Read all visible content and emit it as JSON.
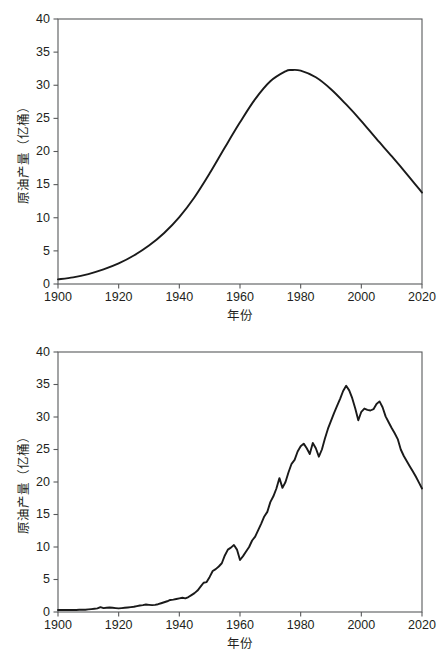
{
  "page": {
    "background": "#ffffff",
    "line_color": "#1a1a1a",
    "axis_color": "#58595b",
    "text_color": "#231f20"
  },
  "charts": [
    {
      "id": "top",
      "panel_label": "hubbert-curve-panel",
      "xlabel": "年份",
      "ylabel": "原油产量（亿桶）",
      "title": "",
      "xlim": [
        1900,
        2020
      ],
      "ylim": [
        0,
        40
      ],
      "xticks": [
        1900,
        1920,
        1940,
        1960,
        1980,
        2000,
        2020
      ],
      "xticklabels": [
        "1900",
        "1920",
        "1940",
        "1960",
        "1980",
        "2000",
        "2020"
      ],
      "yticks": [
        0,
        5,
        10,
        15,
        20,
        25,
        30,
        35,
        40
      ],
      "yticklabels": [
        "0",
        "5",
        "10",
        "15",
        "20",
        "25",
        "30",
        "35",
        "40"
      ],
      "grid": false,
      "legend": null
    },
    {
      "id": "bottom",
      "panel_label": "actual-production-panel",
      "xlabel": "年份",
      "ylabel": "原油产量（亿桶）",
      "title": "",
      "xlim": [
        1900,
        2020
      ],
      "ylim": [
        0,
        40
      ],
      "xticks": [
        1900,
        1920,
        1940,
        1960,
        1980,
        2000,
        2020
      ],
      "xticklabels": [
        "1900",
        "1920",
        "1940",
        "1960",
        "1980",
        "2000",
        "2020"
      ],
      "yticks": [
        0,
        5,
        10,
        15,
        20,
        25,
        30,
        35,
        40
      ],
      "yticklabels": [
        "0",
        "5",
        "10",
        "15",
        "20",
        "25",
        "30",
        "35",
        "40"
      ],
      "grid": false,
      "legend": null
    }
  ],
  "chart_data": [
    {
      "type": "line",
      "id": "top",
      "title": "",
      "xlabel": "年份",
      "ylabel": "原油产量（亿桶）",
      "xlim": [
        1900,
        2020
      ],
      "ylim": [
        0,
        40
      ],
      "grid": false,
      "legend": null,
      "series": [
        {
          "name": "原油产量（理论曲线）",
          "x": [
            1900,
            1905,
            1910,
            1915,
            1920,
            1925,
            1930,
            1935,
            1940,
            1945,
            1950,
            1955,
            1960,
            1965,
            1970,
            1975,
            1977,
            1980,
            1985,
            1990,
            1995,
            2000,
            2005,
            2010,
            2015,
            2020
          ],
          "y": [
            0.7,
            1.0,
            1.5,
            2.2,
            3.1,
            4.3,
            5.8,
            7.7,
            10.1,
            13.1,
            16.7,
            20.6,
            24.4,
            27.9,
            30.6,
            32.1,
            32.3,
            32.2,
            31.2,
            29.4,
            27.1,
            24.6,
            21.9,
            19.3,
            16.6,
            13.8
          ]
        }
      ]
    },
    {
      "type": "line",
      "id": "bottom",
      "title": "",
      "xlabel": "年份",
      "ylabel": "原油产量（亿桶）",
      "xlim": [
        1900,
        2020
      ],
      "ylim": [
        0,
        40
      ],
      "grid": false,
      "legend": null,
      "series": [
        {
          "name": "原油产量（实际数据）",
          "x": [
            1900,
            1901,
            1902,
            1903,
            1904,
            1905,
            1906,
            1907,
            1908,
            1909,
            1910,
            1911,
            1912,
            1913,
            1914,
            1915,
            1916,
            1917,
            1918,
            1919,
            1920,
            1921,
            1922,
            1923,
            1924,
            1925,
            1926,
            1927,
            1928,
            1929,
            1930,
            1931,
            1932,
            1933,
            1934,
            1935,
            1936,
            1937,
            1938,
            1939,
            1940,
            1941,
            1942,
            1943,
            1944,
            1945,
            1946,
            1947,
            1948,
            1949,
            1950,
            1951,
            1952,
            1953,
            1954,
            1955,
            1956,
            1957,
            1958,
            1959,
            1960,
            1961,
            1962,
            1963,
            1964,
            1965,
            1966,
            1967,
            1968,
            1969,
            1970,
            1971,
            1972,
            1973,
            1974,
            1975,
            1976,
            1977,
            1978,
            1979,
            1980,
            1981,
            1982,
            1983,
            1984,
            1985,
            1986,
            1987,
            1988,
            1989,
            1990,
            1991,
            1992,
            1993,
            1994,
            1995,
            1996,
            1997,
            1998,
            1999,
            2000,
            2001,
            2002,
            2003,
            2004,
            2005,
            2006,
            2007,
            2008,
            2009,
            2010,
            2011,
            2012,
            2013,
            2014,
            2015,
            2016,
            2017,
            2018,
            2019,
            2020
          ],
          "y": [
            0.3,
            0.3,
            0.3,
            0.3,
            0.3,
            0.3,
            0.3,
            0.35,
            0.35,
            0.35,
            0.4,
            0.45,
            0.5,
            0.55,
            0.75,
            0.6,
            0.65,
            0.7,
            0.65,
            0.6,
            0.55,
            0.6,
            0.65,
            0.7,
            0.75,
            0.8,
            0.9,
            1.0,
            1.05,
            1.15,
            1.1,
            1.05,
            1.1,
            1.2,
            1.35,
            1.5,
            1.65,
            1.85,
            1.9,
            2.0,
            2.1,
            2.2,
            2.1,
            2.3,
            2.6,
            2.9,
            3.3,
            3.9,
            4.5,
            4.6,
            5.4,
            6.3,
            6.6,
            7.0,
            7.5,
            8.7,
            9.6,
            9.9,
            10.3,
            9.6,
            8.0,
            8.6,
            9.3,
            10.0,
            11.0,
            11.6,
            12.6,
            13.6,
            14.7,
            15.4,
            16.9,
            17.8,
            19.0,
            20.6,
            19.1,
            20.0,
            21.5,
            22.8,
            23.4,
            24.7,
            25.5,
            25.9,
            25.2,
            24.3,
            26.0,
            25.2,
            23.9,
            25.0,
            26.7,
            28.2,
            29.4,
            30.6,
            31.7,
            32.8,
            34.0,
            34.8,
            34.1,
            32.9,
            31.3,
            29.5,
            30.8,
            31.3,
            31.1,
            31.0,
            31.2,
            32.0,
            32.4,
            31.5,
            30.1,
            29.2,
            28.3,
            27.5,
            26.6,
            25.0,
            24.0,
            23.2,
            22.4,
            21.6,
            20.8,
            19.9,
            19.0,
            18.4,
            18.5,
            19.0,
            20.5,
            26.0,
            31.5,
            34.3,
            31.8,
            33.8,
            32.2
          ]
        }
      ]
    }
  ]
}
